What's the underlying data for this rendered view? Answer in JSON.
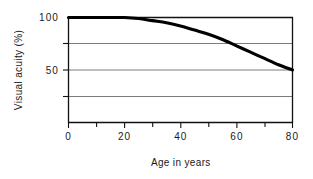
{
  "chart_data": {
    "type": "line",
    "title": "",
    "xlabel": "Age in years",
    "ylabel": "Visual acuity (%)",
    "xlim": [
      0,
      80
    ],
    "ylim": [
      0,
      100
    ],
    "grid": true,
    "legend": "none",
    "x_ticks_major": [
      0,
      20,
      40,
      60,
      80
    ],
    "x_tick_labels": [
      "0",
      "20",
      "40",
      "60",
      "80"
    ],
    "x_ticks_minor": [
      10,
      30,
      50,
      70
    ],
    "y_ticks_labeled": [
      100,
      50
    ],
    "y_tick_labels": [
      "100",
      "50"
    ],
    "y_gridlines": [
      75,
      50,
      25
    ],
    "series": [
      {
        "name": "Visual acuity",
        "x": [
          0,
          5,
          10,
          15,
          20,
          25,
          30,
          35,
          40,
          45,
          50,
          55,
          60,
          65,
          70,
          75,
          80
        ],
        "values": [
          100,
          100,
          100,
          100,
          100,
          99,
          97,
          95,
          92,
          88,
          84,
          79,
          73,
          67,
          61,
          55,
          50
        ]
      }
    ]
  },
  "axes": {
    "y_label_top": "100",
    "y_label_mid": "50",
    "y_title": "Visual acuity (%)",
    "x_title": "Age in years",
    "x_label_0": "0",
    "x_label_20": "20",
    "x_label_40": "40",
    "x_label_60": "60",
    "x_label_80": "80"
  },
  "colors": {
    "curve": "#000000",
    "frame": "#111111",
    "grid": "#5b5b5b",
    "background": "#ffffff",
    "text": "#1a1a1a"
  }
}
